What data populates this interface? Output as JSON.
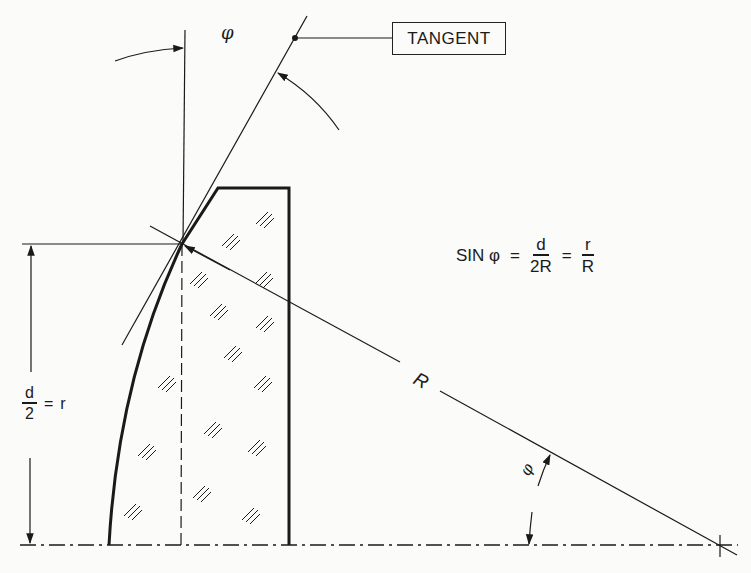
{
  "diagram": {
    "type": "technical-drawing",
    "labels": {
      "tangent": "TANGENT",
      "phi_top": "φ",
      "phi_bottom": "φ",
      "radius": "R",
      "half_diameter": {
        "numerator": "d",
        "denominator": "2",
        "equals": "=",
        "rhs": "r"
      }
    },
    "formula": {
      "lhs": "SIN φ",
      "eq1": "=",
      "frac1": {
        "numerator": "d",
        "denominator": "2R"
      },
      "eq2": "=",
      "frac2": {
        "numerator": "r",
        "denominator": "R"
      }
    },
    "elements": [
      "vertical reference line",
      "tangent line",
      "lens cross-section (hatched glass)",
      "radius line to center of curvature",
      "optical axis (dash-dot)",
      "dimension arrow d/2"
    ],
    "colors": {
      "background": "#fbfbf9",
      "ink": "#1a1a1a"
    }
  }
}
